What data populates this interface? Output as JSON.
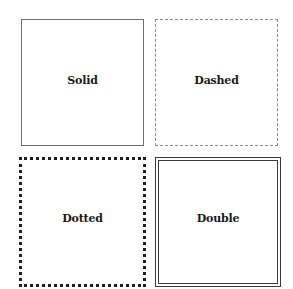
{
  "boxes": [
    {
      "id": "solid",
      "label": "Solid",
      "border_style": "solid",
      "border_color": "#6e6e6e"
    },
    {
      "id": "dashed",
      "label": "Dashed",
      "border_style": "dashed",
      "border_color": "#8a8a8a"
    },
    {
      "id": "dotted",
      "label": "Dotted",
      "border_style": "dotted",
      "border_color": "#1e1e1e"
    },
    {
      "id": "double",
      "label": "Double",
      "border_style": "double",
      "border_color": "#3c3c3c"
    }
  ]
}
